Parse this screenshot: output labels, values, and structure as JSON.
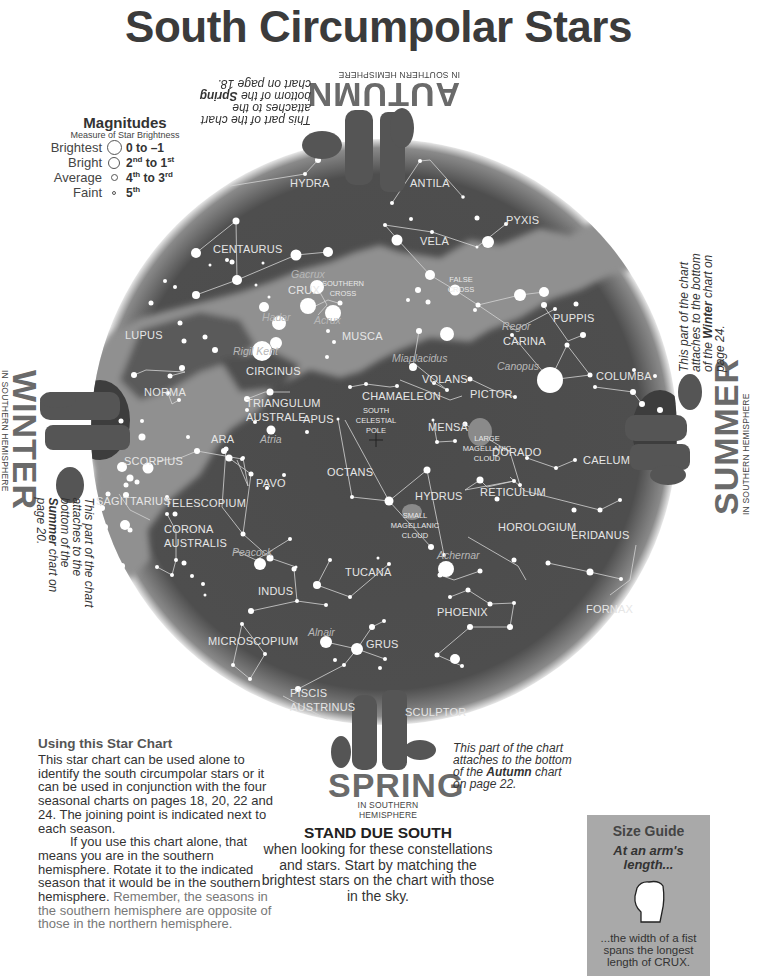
{
  "title": "South Circumpolar Stars",
  "magnitudes": {
    "heading": "Magnitudes",
    "subheading": "Measure of Star Brightness",
    "rows": [
      {
        "label": "Brightest",
        "value": "0 to –1",
        "size": 15
      },
      {
        "label": "Bright",
        "value_a": "2",
        "sup_a": "nd",
        "value_b": " to 1",
        "sup_b": "st",
        "size": 12
      },
      {
        "label": "Average",
        "value_a": "4",
        "sup_a": "th",
        "value_b": " to 3",
        "sup_b": "rd",
        "size": 7
      },
      {
        "label": "Faint",
        "value_a": "5",
        "sup_a": "th",
        "size": 4
      }
    ]
  },
  "chart": {
    "center": [
      384,
      432
    ],
    "radius": 293,
    "colors": {
      "sky": "#4a4a4a",
      "milky_way": "#8f8f8f",
      "star": "#ffffff",
      "line": "#cfcfcf",
      "label": "#e6e6e6",
      "star_name": "#b8b8b8"
    },
    "constellations": [
      {
        "name": "HYDRA",
        "x": 290,
        "y": 187
      },
      {
        "name": "ANTILA",
        "x": 410,
        "y": 187
      },
      {
        "name": "PYXIS",
        "x": 506,
        "y": 224
      },
      {
        "name": "VELA",
        "x": 420,
        "y": 245
      },
      {
        "name": "CENTAURUS",
        "x": 213,
        "y": 253
      },
      {
        "name": "CRUX",
        "x": 288,
        "y": 294
      },
      {
        "name": "PUPPIS",
        "x": 553,
        "y": 322
      },
      {
        "name": "MUSCA",
        "x": 342,
        "y": 340
      },
      {
        "name": "LUPUS",
        "x": 125,
        "y": 339
      },
      {
        "name": "CARINA",
        "x": 503,
        "y": 345
      },
      {
        "name": "CIRCINUS",
        "x": 246,
        "y": 375
      },
      {
        "name": "VOLANS",
        "x": 422,
        "y": 383
      },
      {
        "name": "COLUMBA",
        "x": 596,
        "y": 380
      },
      {
        "name": "NORMA",
        "x": 144,
        "y": 396
      },
      {
        "name": "CHAMAELEON",
        "x": 362,
        "y": 400
      },
      {
        "name": "PICTOR",
        "x": 470,
        "y": 398
      },
      {
        "name": "TRIANGULUM",
        "x": 246,
        "y": 407
      },
      {
        "name": "AUSTRALE",
        "x": 246,
        "y": 421
      },
      {
        "name": "APUS",
        "x": 303,
        "y": 423
      },
      {
        "name": "MENSA",
        "x": 428,
        "y": 431
      },
      {
        "name": "ARA",
        "x": 211,
        "y": 443
      },
      {
        "name": "DORADO",
        "x": 492,
        "y": 456
      },
      {
        "name": "CAELUM",
        "x": 583,
        "y": 464
      },
      {
        "name": "SCORPIUS",
        "x": 124,
        "y": 465
      },
      {
        "name": "OCTANS",
        "x": 327,
        "y": 476
      },
      {
        "name": "PAVO",
        "x": 256,
        "y": 487
      },
      {
        "name": "HYDRUS",
        "x": 415,
        "y": 500
      },
      {
        "name": "RETICULUM",
        "x": 480,
        "y": 496
      },
      {
        "name": "SAGITTARIUS",
        "x": 96,
        "y": 505
      },
      {
        "name": "TELESCOPIUM",
        "x": 165,
        "y": 507
      },
      {
        "name": "HOROLOGIUM",
        "x": 498,
        "y": 531
      },
      {
        "name": "ERIDANUS",
        "x": 571,
        "y": 539
      },
      {
        "name": "CORONA",
        "x": 164,
        "y": 533
      },
      {
        "name": "AUSTRALIS",
        "x": 164,
        "y": 547
      },
      {
        "name": "TUCANA",
        "x": 345,
        "y": 576
      },
      {
        "name": "INDUS",
        "x": 258,
        "y": 595
      },
      {
        "name": "PHOENIX",
        "x": 437,
        "y": 616
      },
      {
        "name": "FORNAX",
        "x": 586,
        "y": 613
      },
      {
        "name": "MICROSCOPIUM",
        "x": 208,
        "y": 645
      },
      {
        "name": "GRUS",
        "x": 366,
        "y": 648
      },
      {
        "name": "PISCIS",
        "x": 290,
        "y": 697
      },
      {
        "name": "AUSTRINUS",
        "x": 290,
        "y": 711
      },
      {
        "name": "SCULPTOR",
        "x": 405,
        "y": 716
      }
    ],
    "small_labels": [
      {
        "text": "SOUTHERN",
        "x": 343,
        "y": 286
      },
      {
        "text": "CROSS",
        "x": 343,
        "y": 296
      },
      {
        "text": "FALSE",
        "x": 461,
        "y": 282
      },
      {
        "text": "CROSS",
        "x": 461,
        "y": 292
      },
      {
        "text": "SOUTH",
        "x": 376,
        "y": 413
      },
      {
        "text": "CELESTIAL",
        "x": 376,
        "y": 423
      },
      {
        "text": "POLE",
        "x": 376,
        "y": 433
      },
      {
        "text": "LARGE",
        "x": 487,
        "y": 441
      },
      {
        "text": "MAGELLANIC",
        "x": 487,
        "y": 451
      },
      {
        "text": "CLOUD",
        "x": 487,
        "y": 461
      },
      {
        "text": "SMALL",
        "x": 415,
        "y": 518
      },
      {
        "text": "MAGELLANIC",
        "x": 415,
        "y": 528
      },
      {
        "text": "CLOUD",
        "x": 415,
        "y": 538
      }
    ],
    "star_names": [
      {
        "name": "Gacrux",
        "x": 291,
        "y": 278
      },
      {
        "name": "Hadar",
        "x": 262,
        "y": 321
      },
      {
        "name": "Acrux",
        "x": 314,
        "y": 324
      },
      {
        "name": "Rigil Kent",
        "x": 233,
        "y": 355
      },
      {
        "name": "Regor",
        "x": 502,
        "y": 330
      },
      {
        "name": "Miaplacidus",
        "x": 392,
        "y": 362
      },
      {
        "name": "Canopus",
        "x": 497,
        "y": 370
      },
      {
        "name": "Atria",
        "x": 260,
        "y": 443
      },
      {
        "name": "Peacock",
        "x": 232,
        "y": 556
      },
      {
        "name": "Achernar",
        "x": 437,
        "y": 559
      },
      {
        "name": "Alnair",
        "x": 308,
        "y": 636
      }
    ]
  },
  "seasons": {
    "autumn": {
      "name": "AUTUMN",
      "sub": "IN SOUTHERN HEMISPHERE",
      "note_a": "This part of the chart attaches to the bottom of the ",
      "note_b": "Spring",
      "note_c": " chart on page 18."
    },
    "winter": {
      "name": "WINTER",
      "sub": "IN SOUTHERN HEMISPHERE",
      "note_a": "This part of the chart attaches to the bottom of the ",
      "note_b": "Summer",
      "note_c": " chart on page 20."
    },
    "summer": {
      "name": "SUMMER",
      "sub": "IN SOUTHERN HEMISPHERE",
      "note_a": "This part of the chart attaches to the bottom of the ",
      "note_b": "Winter",
      "note_c": " chart on page 24."
    },
    "spring": {
      "name": "SPRING",
      "sub": "IN SOUTHERN HEMISPHERE",
      "note_a": "This part of the chart attaches to the bottom of the ",
      "note_b": "Autumn",
      "note_c": " chart on page 22."
    }
  },
  "using": {
    "heading": "Using this Star Chart",
    "para1": "This star chart can be used alone to identify the south circumpolar stars or it can be used in conjunction with the four seasonal charts on pages 18, 20, 22 and 24. The joining point is indicated next to each season.",
    "para2": "If you use this chart alone, that means you are in the southern hemisphere. Rotate it to the indicated season that it would be in the southern hemisphere. ",
    "para2_gray": "Remember, the seasons in the southern hemisphere are opposite of those in the northern hemisphere."
  },
  "stand": {
    "heading": "STAND DUE SOUTH",
    "body": "when looking for these constellations and stars. Start by matching the brightest stars on the chart with those in the sky."
  },
  "size_guide": {
    "heading": "Size Guide",
    "italic": "At an arm's length...",
    "body": "...the width of a fist spans the longest length of CRUX."
  }
}
